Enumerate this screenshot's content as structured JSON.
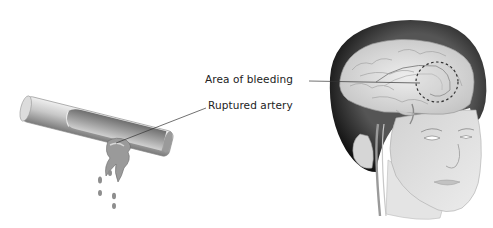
{
  "diagram": {
    "type": "medical-illustration",
    "labels": {
      "area_of_bleeding": "Area of bleeding",
      "ruptured_artery": "Ruptured artery"
    },
    "colors": {
      "background": "#ffffff",
      "hair": "#1a1a1a",
      "skin": "#e2e2e2",
      "brain": "#d8d8d8",
      "artery": "#b5b5b5",
      "label_text": "#222222",
      "leader_line": "#333333"
    }
  }
}
